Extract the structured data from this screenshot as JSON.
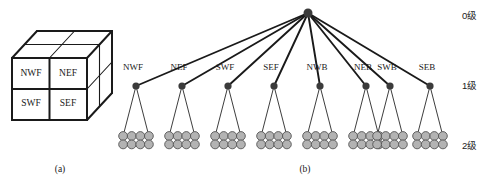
{
  "figure": {
    "width": 504,
    "height": 194,
    "background": "#ffffff",
    "stroke_color": "#1a1a1a",
    "node_fill": "#3b3b3b",
    "leaf_fill": "#b3b3b3",
    "leaf_stroke": "#555555"
  },
  "panel_a": {
    "caption": "(a)",
    "caption_x": 60,
    "caption_y": 172,
    "front_face_labels": [
      {
        "text": "NWF",
        "x": 31,
        "y": 74
      },
      {
        "text": "NEF",
        "x": 68,
        "y": 74
      },
      {
        "text": "SWF",
        "x": 31,
        "y": 104
      },
      {
        "text": "SEF",
        "x": 68,
        "y": 104
      }
    ],
    "cube": {
      "front_x": 12,
      "front_y": 58,
      "front_w": 75,
      "front_h": 62,
      "depth_dx": 25,
      "depth_dy": -27
    }
  },
  "panel_b": {
    "caption": "(b)",
    "caption_x": 305,
    "caption_y": 172,
    "root": {
      "x": 308,
      "y": 13,
      "r": 4.5
    },
    "level_labels": [
      {
        "text": "0级",
        "x": 462,
        "y": 19
      },
      {
        "text": "1级",
        "x": 462,
        "y": 89
      },
      {
        "text": "2级",
        "x": 462,
        "y": 149
      }
    ],
    "children": [
      {
        "label": "NWF",
        "x": 136,
        "y": 86,
        "label_x": 133,
        "label_y": 70
      },
      {
        "label": "NEF",
        "x": 182,
        "y": 86,
        "label_x": 179,
        "label_y": 70
      },
      {
        "label": "SWF",
        "x": 228,
        "y": 86,
        "label_x": 225,
        "label_y": 70
      },
      {
        "label": "SEF",
        "x": 274,
        "y": 86,
        "label_x": 271,
        "label_y": 70
      },
      {
        "label": "NWB",
        "x": 320,
        "y": 86,
        "label_x": 317,
        "label_y": 70
      },
      {
        "label": "NEB",
        "x": 366,
        "y": 86,
        "label_x": 363,
        "label_y": 70
      },
      {
        "label": "SWB",
        "x": 390,
        "y": 86,
        "label_x": 387,
        "label_y": 70
      },
      {
        "label": "SEB",
        "x": 430,
        "y": 86,
        "label_x": 427,
        "label_y": 70
      }
    ],
    "leaf_cluster": {
      "columns": 4,
      "rows": 2,
      "circle_r": 4.4,
      "spacing_x": 8.6,
      "spacing_y": 8.4,
      "top_y": 136
    }
  }
}
